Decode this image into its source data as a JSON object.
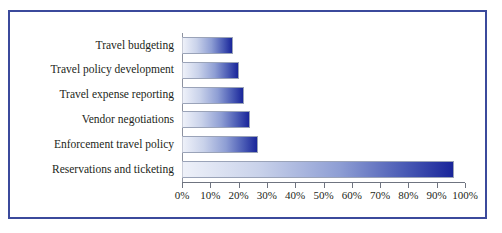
{
  "chart_data": {
    "type": "bar",
    "orientation": "horizontal",
    "title": "",
    "subtitle": "",
    "xlabel": "",
    "ylabel": "",
    "categories": [
      "Travel budgeting",
      "Travel policy development",
      "Travel expense reporting",
      "Vendor negotiations",
      "Enforcement travel policy",
      "Reservations and ticketing"
    ],
    "values": [
      18,
      20,
      22,
      24,
      27,
      96
    ],
    "value_unit": "%",
    "xlim": [
      0,
      100
    ],
    "tick_labels": [
      "0%",
      "10%",
      "20%",
      "30%",
      "40%",
      "50%",
      "60%",
      "70%",
      "80%",
      "90%",
      "100%"
    ],
    "tick_values": [
      0,
      10,
      20,
      30,
      40,
      50,
      60,
      70,
      80,
      90,
      100
    ],
    "grid": false,
    "legend": false,
    "series": [
      {
        "name": "",
        "values": [
          18,
          20,
          22,
          24,
          27,
          96
        ]
      }
    ],
    "colors": {
      "bar_gradient_start": "#eef1f9",
      "bar_gradient_end": "#19259a",
      "bar_border": "#9aa3b8",
      "frame_border": "#3b4a9c",
      "axis_line": "#6f7480",
      "text": "#231f20",
      "background": "#ffffff"
    }
  }
}
